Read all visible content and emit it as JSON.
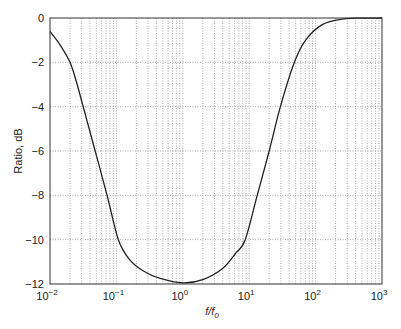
{
  "chart_data": {
    "type": "line",
    "title": "",
    "xlabel": "f/f0",
    "xlabel_main": "f/f",
    "xlabel_sub": "0",
    "ylabel": "Ratio, dB",
    "xscale": "log",
    "xlim": [
      0.01,
      1000
    ],
    "ylim": [
      -12,
      0
    ],
    "grid": true,
    "legend": null,
    "x_ticks": [
      {
        "base": "10",
        "exp": "-2",
        "value": 0.01
      },
      {
        "base": "10",
        "exp": "-1",
        "value": 0.1
      },
      {
        "base": "10",
        "exp": "0",
        "value": 1
      },
      {
        "base": "10",
        "exp": "1",
        "value": 10
      },
      {
        "base": "10",
        "exp": "2",
        "value": 100
      },
      {
        "base": "10",
        "exp": "3",
        "value": 1000
      }
    ],
    "y_ticks": [
      "0",
      "−2",
      "−4",
      "−6",
      "−8",
      "−10",
      "−12"
    ],
    "y_tick_values": [
      0,
      -2,
      -4,
      -6,
      -8,
      -10,
      -12
    ],
    "series": [
      {
        "name": "Ratio",
        "color": "#222222",
        "x": [
          0.01,
          0.0141,
          0.02,
          0.0251,
          0.0316,
          0.0479,
          0.0724,
          0.107,
          0.158,
          0.251,
          0.457,
          1.0,
          2.0,
          3.98,
          6.31,
          8.71,
          13.2,
          20.0,
          29.5,
          47.9,
          70.8,
          126,
          251,
          398,
          1000
        ],
        "y": [
          -0.6,
          -1.2,
          -2.0,
          -2.9,
          -4.0,
          -6.0,
          -8.0,
          -10.0,
          -10.9,
          -11.4,
          -11.75,
          -11.95,
          -11.8,
          -11.3,
          -10.6,
          -10.0,
          -8.0,
          -6.0,
          -4.0,
          -2.0,
          -1.0,
          -0.3,
          -0.05,
          -0.01,
          0.0
        ]
      }
    ]
  }
}
